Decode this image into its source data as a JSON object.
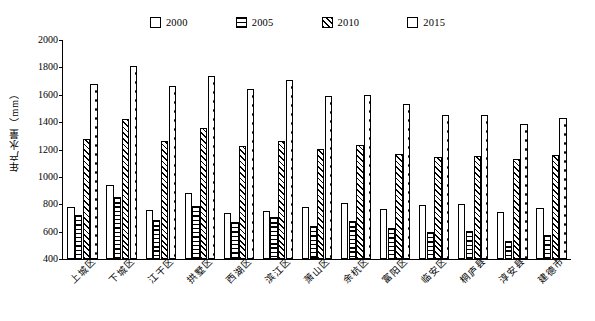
{
  "chart_data": {
    "type": "bar",
    "title": "",
    "xlabel": "",
    "ylabel": "年产水量（mm）",
    "ylim": [
      400,
      2000
    ],
    "ytick_step": 200,
    "yticks": [
      2000,
      1800,
      1600,
      1400,
      1200,
      1000,
      800,
      600,
      400
    ],
    "grid": false,
    "legend_position": "top",
    "categories": [
      "上城区",
      "下城区",
      "江干区",
      "拱墅区",
      "西湖区",
      "滨江区",
      "萧山区",
      "余杭区",
      "富阳区",
      "临安区",
      "桐庐县",
      "淳安县",
      "建德市"
    ],
    "series": [
      {
        "name": "2000",
        "pattern": "plain",
        "values": [
          780,
          940,
          760,
          880,
          735,
          750,
          780,
          810,
          765,
          795,
          800,
          745,
          775
        ]
      },
      {
        "name": "2005",
        "pattern": "horizontal-lines",
        "values": [
          720,
          855,
          685,
          790,
          670,
          710,
          640,
          680,
          630,
          600,
          605,
          530,
          575
        ]
      },
      {
        "name": "2010",
        "pattern": "diagonal-hatch",
        "values": [
          1275,
          1425,
          1260,
          1355,
          1225,
          1260,
          1205,
          1235,
          1170,
          1145,
          1150,
          1130,
          1160
        ]
      },
      {
        "name": "2015",
        "pattern": "dotted",
        "values": [
          1680,
          1810,
          1665,
          1740,
          1640,
          1710,
          1590,
          1600,
          1535,
          1450,
          1455,
          1390,
          1430
        ]
      }
    ]
  },
  "legend": {
    "items": [
      {
        "label": "2000",
        "pattern": "plain"
      },
      {
        "label": "2005",
        "pattern": "horizontal-lines"
      },
      {
        "label": "2010",
        "pattern": "diagonal-hatch"
      },
      {
        "label": "2015",
        "pattern": "dotted"
      }
    ]
  }
}
